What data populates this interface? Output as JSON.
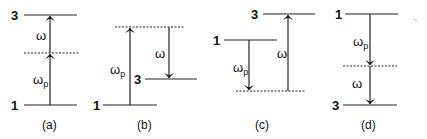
{
  "diagram": {
    "type": "energy-level transition diagrams",
    "panels": [
      {
        "caption": "(a)",
        "levels": [
          {
            "label": "3"
          },
          {
            "label": "1"
          }
        ],
        "transitions": [
          {
            "label": "ω",
            "subscript": "",
            "direction": "up"
          },
          {
            "label": "ω",
            "subscript": "p",
            "direction": "up"
          }
        ]
      },
      {
        "caption": "(b)",
        "levels": [
          {
            "label": "1"
          },
          {
            "label": "3"
          }
        ],
        "transitions": [
          {
            "label": "ω",
            "subscript": "p",
            "direction": "up"
          },
          {
            "label": "ω",
            "subscript": "",
            "direction": "down"
          }
        ]
      },
      {
        "caption": "(c)",
        "levels": [
          {
            "label": "3"
          },
          {
            "label": "1"
          }
        ],
        "transitions": [
          {
            "label": "ω",
            "subscript": "p",
            "direction": "down"
          },
          {
            "label": "ω",
            "subscript": "",
            "direction": "up"
          }
        ]
      },
      {
        "caption": "(d)",
        "levels": [
          {
            "label": "1"
          },
          {
            "label": "3"
          }
        ],
        "transitions": [
          {
            "label": "ω",
            "subscript": "p",
            "direction": "down"
          },
          {
            "label": "ω",
            "subscript": "",
            "direction": "down"
          }
        ]
      }
    ]
  }
}
